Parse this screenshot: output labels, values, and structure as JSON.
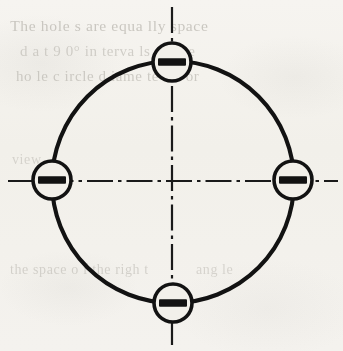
{
  "page": {
    "width": 343,
    "height": 351,
    "paper_color": "#f2f0ea",
    "ink_color": "#121212",
    "ghost_text_color": "#b9b6af"
  },
  "ghost_text": {
    "line_1": "The  hole s  are  equa lly  space",
    "line_2": "d  a t  9 0°  in terva ls  on  the",
    "line_3": "ho le   c ircle   d iame te r.  For",
    "line_4": "view",
    "line_5": "the  space   o f  the   righ t",
    "line_6": "ang le"
  },
  "drawing": {
    "type": "engineering-drawing",
    "description": "Four holes equally spaced on a bolt circle with dash-dot centerlines",
    "center": {
      "x": 173,
      "y": 182
    },
    "bolt_circle": {
      "name": "bolt-circle",
      "radius": 121,
      "stroke_width": 4.1,
      "stroke": "#121212",
      "fill": "none"
    },
    "centerlines": {
      "name": "centerlines",
      "stroke": "#1a1a1a",
      "stroke_width": 2.2,
      "dash_pattern": "26 5 3.5 5",
      "horizontal": {
        "x1": 8,
        "y1": 181,
        "x2": 338,
        "y2": 181
      },
      "vertical": {
        "x1": 172,
        "y1": 7,
        "x2": 172,
        "y2": 345
      }
    },
    "holes": [
      {
        "id": "hole-top",
        "label": "top",
        "angle_deg": 90,
        "clock": "12 o'clock",
        "cx": 172,
        "cy": 62,
        "r": 19,
        "stroke_width": 3.6,
        "slot_width": 28,
        "slot_height": 7.5
      },
      {
        "id": "hole-right",
        "label": "right",
        "angle_deg": 0,
        "clock": "3 o'clock",
        "cx": 293,
        "cy": 180,
        "r": 19,
        "stroke_width": 3.6,
        "slot_width": 28,
        "slot_height": 7.5
      },
      {
        "id": "hole-bottom",
        "label": "bottom",
        "angle_deg": 270,
        "clock": "6 o'clock",
        "cx": 173,
        "cy": 303,
        "r": 19,
        "stroke_width": 3.6,
        "slot_width": 28,
        "slot_height": 7.5
      },
      {
        "id": "hole-left",
        "label": "left",
        "angle_deg": 180,
        "clock": "9 o'clock",
        "cx": 52,
        "cy": 180,
        "r": 19,
        "stroke_width": 3.6,
        "slot_width": 28,
        "slot_height": 7.5
      }
    ],
    "hole_count": 4,
    "spacing_deg": 90
  }
}
